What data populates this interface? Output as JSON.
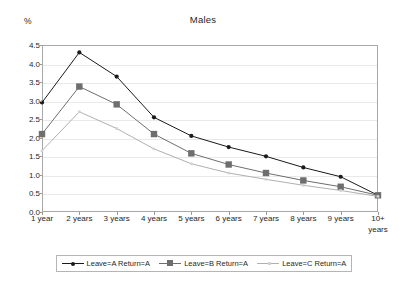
{
  "chart_data": {
    "type": "line",
    "title": "Males",
    "xlabel": "",
    "ylabel": "%",
    "ylim": [
      0,
      4.5
    ],
    "ytick_step": 0.5,
    "grid": true,
    "legend_position": "bottom",
    "categories": [
      "1 year",
      "2 years",
      "3 years",
      "4 years",
      "5 years",
      "6 years",
      "7 years",
      "8 years",
      "9 years",
      "10+\nyears"
    ],
    "ytick_labels": [
      "0.0",
      "0.5",
      "1.0",
      "1.5",
      "2.0",
      "2.5",
      "3.0",
      "3.5",
      "4.0",
      "4.5"
    ],
    "series": [
      {
        "name": "Leave=A Return=A",
        "color": "#1a1a1a",
        "marker": "diamond",
        "values": [
          2.95,
          4.3,
          3.65,
          2.55,
          2.05,
          1.75,
          1.5,
          1.2,
          0.95,
          0.45
        ]
      },
      {
        "name": "Leave=B Return=A",
        "color": "#6e6e6e",
        "marker": "square",
        "values": [
          2.1,
          3.38,
          2.9,
          2.1,
          1.58,
          1.28,
          1.05,
          0.85,
          0.68,
          0.45
        ]
      },
      {
        "name": "Leave=C Return=A",
        "color": "#b0b0b0",
        "marker": "none",
        "values": [
          1.65,
          2.7,
          2.25,
          1.7,
          1.3,
          1.05,
          0.88,
          0.72,
          0.58,
          0.42
        ]
      }
    ]
  },
  "legend": {
    "items": [
      {
        "label": "Leave=A Return=A"
      },
      {
        "label": "Leave=B Return=A"
      },
      {
        "label": "Leave=C Return=A"
      }
    ]
  }
}
